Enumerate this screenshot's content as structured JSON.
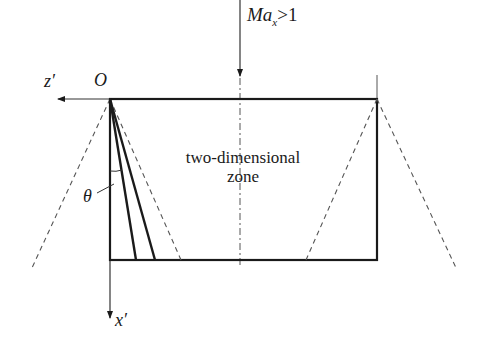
{
  "diagram": {
    "inflow_label": {
      "main": "Ma",
      "sub": "x",
      "rel": ">1"
    },
    "origin_label": "O",
    "z_axis_label": "z′",
    "x_axis_label": "x′",
    "angle_label": "θ",
    "zone_label_line1": "two-dimensional",
    "zone_label_line2": "zone",
    "colors": {
      "solid": "#1a1a1a",
      "thin": "#333333",
      "dashed": "#555555"
    }
  }
}
